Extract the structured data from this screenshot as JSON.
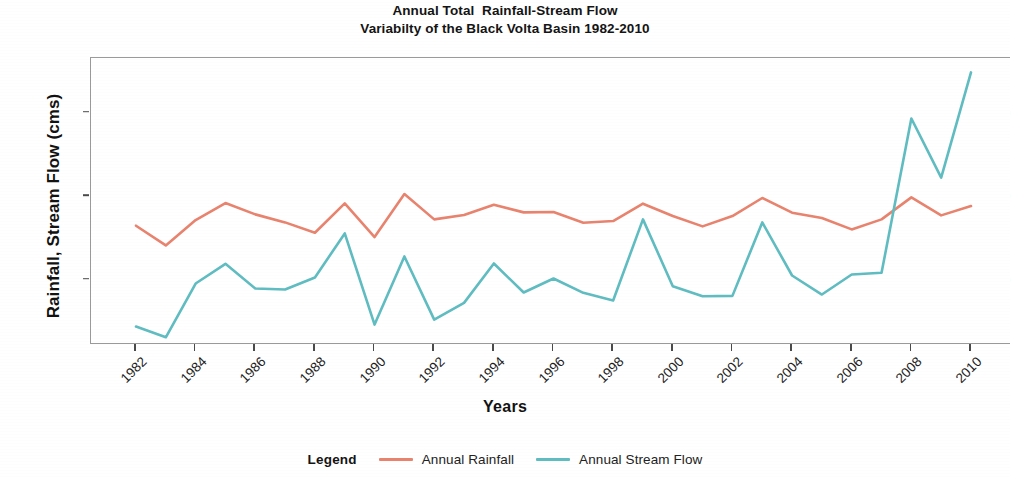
{
  "chart_data": {
    "type": "line",
    "title": "Annual Total  Rainfall-Stream Flow",
    "subtitle": "Variabilty of the Black Volta Basin 1982-2010",
    "xlabel": "Years",
    "ylabel": "Rainfall, Stream Flow (cms)",
    "x": [
      1982,
      1983,
      1984,
      1985,
      1986,
      1987,
      1988,
      1989,
      1990,
      1991,
      1992,
      1993,
      1994,
      1995,
      1996,
      1997,
      1998,
      1999,
      2000,
      2001,
      2002,
      2003,
      2004,
      2005,
      2006,
      2007,
      2008,
      2009,
      2010
    ],
    "xlim": [
      1982,
      2010
    ],
    "ylim": [
      0,
      9100
    ],
    "xticks": [
      1982,
      1984,
      1986,
      1988,
      1990,
      1992,
      1994,
      1996,
      1998,
      2000,
      2002,
      2004,
      2006,
      2008,
      2010
    ],
    "xtick_labels": [
      "1982",
      "1984",
      "1986",
      "1988",
      "1990",
      "1992",
      "1994",
      "1996",
      "1998",
      "2000",
      "2002",
      "2004",
      "2006",
      "2008",
      "2010"
    ],
    "yticks": [
      2500,
      5000,
      7500
    ],
    "ytick_labels": [
      "2500",
      "5000",
      "7500"
    ],
    "grid": false,
    "legend_position": "bottom",
    "legend_title": "Legend",
    "series": [
      {
        "name": "Annual Rainfall",
        "color": "#E8836E",
        "values": [
          4110,
          3520,
          4280,
          4790,
          4450,
          4210,
          3900,
          4780,
          3770,
          5060,
          4300,
          4430,
          4740,
          4510,
          4520,
          4200,
          4250,
          4770,
          4400,
          4090,
          4400,
          4940,
          4500,
          4340,
          4000,
          4300,
          4960,
          4420,
          4700
        ]
      },
      {
        "name": "Annual Stream Flow",
        "color": "#5FBCC0",
        "values": [
          1090,
          770,
          2380,
          2970,
          2230,
          2200,
          2560,
          3880,
          1150,
          3190,
          1300,
          1800,
          2980,
          2110,
          2530,
          2100,
          1870,
          4300,
          2300,
          2000,
          2010,
          4210,
          2620,
          2050,
          2650,
          2700,
          7320,
          5550,
          8700
        ]
      }
    ]
  },
  "legend": {
    "title": "Legend",
    "entries": [
      {
        "label": "Annual Rainfall",
        "color": "#E8836E"
      },
      {
        "label": "Annual Stream Flow",
        "color": "#5FBCC0"
      }
    ]
  },
  "colors": {
    "rainfall": "#E8836E",
    "stream_flow": "#5FBCC0",
    "axis": "#9a9a9a",
    "text": "#1a1a1a",
    "background": "#ffffff"
  }
}
